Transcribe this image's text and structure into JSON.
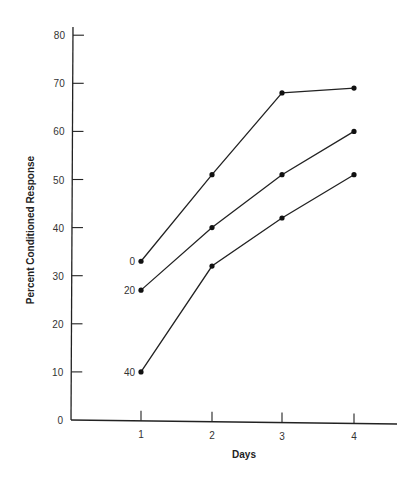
{
  "chart_data": {
    "type": "line",
    "title": "",
    "xlabel": "Days",
    "ylabel": "Percent Conditioned Response",
    "x": [
      1,
      2,
      3,
      4
    ],
    "x_ticks": [
      "1",
      "2",
      "3",
      "4"
    ],
    "y_ticks": [
      "0",
      "10",
      "20",
      "30",
      "40",
      "50",
      "60",
      "70",
      "80"
    ],
    "ylim": [
      0,
      80
    ],
    "grid": false,
    "legend": "inline labels at left of each series",
    "series": [
      {
        "name": "0",
        "values": [
          33,
          51,
          68,
          69
        ]
      },
      {
        "name": "20",
        "values": [
          27,
          40,
          51,
          60
        ]
      },
      {
        "name": "40",
        "values": [
          10,
          32,
          42,
          51
        ]
      }
    ],
    "colors": {
      "line": "#222222",
      "axis": "#222222",
      "text": "#333333"
    }
  }
}
